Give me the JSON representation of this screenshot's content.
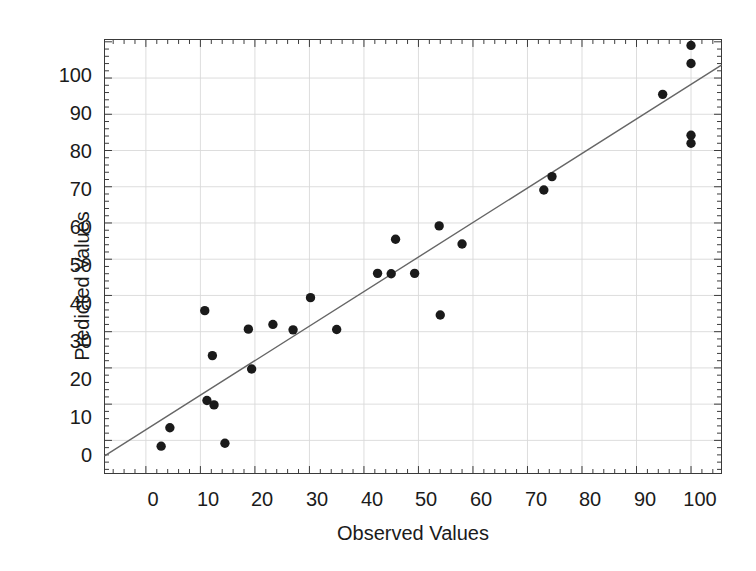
{
  "chart_data": {
    "type": "scatter",
    "title": "",
    "xlabel": "Observed Values",
    "ylabel": "Predicted Values",
    "xlim": [
      -7.5,
      105.5
    ],
    "ylim": [
      -9.0,
      110.5
    ],
    "xticks": [
      0,
      10,
      20,
      30,
      40,
      50,
      60,
      70,
      80,
      90,
      100
    ],
    "yticks": [
      0,
      10,
      20,
      30,
      40,
      50,
      60,
      70,
      80,
      90,
      100
    ],
    "xtick_labels": [
      "0",
      "10",
      "20",
      "30",
      "40",
      "50",
      "60",
      "70",
      "80",
      "90",
      "100"
    ],
    "ytick_labels": [
      "0",
      "10",
      "20",
      "30",
      "40",
      "50",
      "60",
      "70",
      "80",
      "90",
      "100"
    ],
    "grid": true,
    "grid_color": "#d9d9d9",
    "axis_color": "#3a3a3a",
    "marker_color": "#1a1a1a",
    "marker_size": 6.2,
    "legend": "none",
    "x": [
      2.8,
      4.4,
      10.8,
      11.2,
      12.2,
      12.5,
      14.5,
      18.8,
      19.4,
      23.3,
      27.0,
      30.2,
      35.0,
      42.5,
      45.0,
      45.8,
      49.3,
      53.8,
      54.0,
      58.0,
      73.0,
      74.5,
      94.8,
      100.0,
      100.0,
      100.0,
      100.0
    ],
    "y": [
      -1.6,
      3.5,
      35.8,
      11.0,
      23.4,
      9.8,
      -0.8,
      30.7,
      19.7,
      32.0,
      30.5,
      39.4,
      30.6,
      46.1,
      46.0,
      55.5,
      46.1,
      59.2,
      34.6,
      54.2,
      69.1,
      72.8,
      95.5,
      109.0,
      104.0,
      84.2,
      82.0
    ],
    "fit_line": {
      "label": "regression line",
      "color": "#666666",
      "width": 1.4,
      "x_start": -7.5,
      "y_start": -4.2,
      "x_end": 105.5,
      "y_end": 103.5
    }
  }
}
